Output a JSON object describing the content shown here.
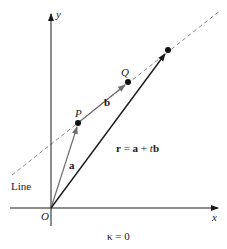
{
  "diagram": {
    "caption": "κ = 0",
    "axes": {
      "x_label": "x",
      "y_label": "y",
      "origin_label": "O"
    },
    "points": [
      {
        "name": "P",
        "label": "P"
      },
      {
        "name": "Q",
        "label": "Q"
      }
    ],
    "vectors": {
      "a_label": "a",
      "b_label": "b",
      "r_equation": {
        "r": "r",
        "eq": " = ",
        "a": "a",
        "plus": " + ",
        "t": "t",
        "b": "b"
      }
    },
    "line_label": "Line",
    "colors": {
      "stroke": "#1a1a1a",
      "vector_gray": "#6e6e6e",
      "dashed": "#8a8a8a",
      "background": "#ffffff"
    }
  }
}
